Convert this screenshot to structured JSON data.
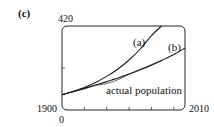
{
  "chart_data": {
    "type": "line",
    "panel_label": "(c)",
    "title": "",
    "xlabel": "",
    "ylabel": "",
    "xlim": [
      1900,
      2010
    ],
    "ylim": [
      0,
      420
    ],
    "x_tick_labels": {
      "left": "1900",
      "right": "2010"
    },
    "y_tick_labels": {
      "bottom": "0",
      "top": "420"
    },
    "x_minor_ticks": [
      1920,
      1940,
      1960,
      1980,
      2000
    ],
    "y_minor_ticks": [
      210
    ],
    "grid": false,
    "legend": "none (curves labeled inline)",
    "series": [
      {
        "name": "(a)",
        "label": "(a)",
        "x": [
          1900,
          1910,
          1920,
          1930,
          1940,
          1950,
          1960,
          1970,
          1980,
          1989
        ],
        "y": [
          76,
          93,
          113,
          138,
          168,
          205,
          250,
          305,
          372,
          420
        ]
      },
      {
        "name": "(b)",
        "label": "(b)",
        "x": [
          1900,
          1910,
          1920,
          1930,
          1940,
          1950,
          1960,
          1970,
          1980,
          1990,
          2000,
          2010
        ],
        "y": [
          76,
          92,
          108,
          125,
          142,
          160,
          180,
          201,
          224,
          250,
          278,
          310
        ]
      },
      {
        "name": "actual population",
        "label": "actual population",
        "x": [
          1900,
          1910,
          1920,
          1930,
          1940,
          1950,
          1960,
          1970,
          1980,
          1990
        ],
        "y": [
          76,
          92,
          106,
          123,
          132,
          151,
          179,
          203,
          227,
          249
        ]
      }
    ]
  }
}
